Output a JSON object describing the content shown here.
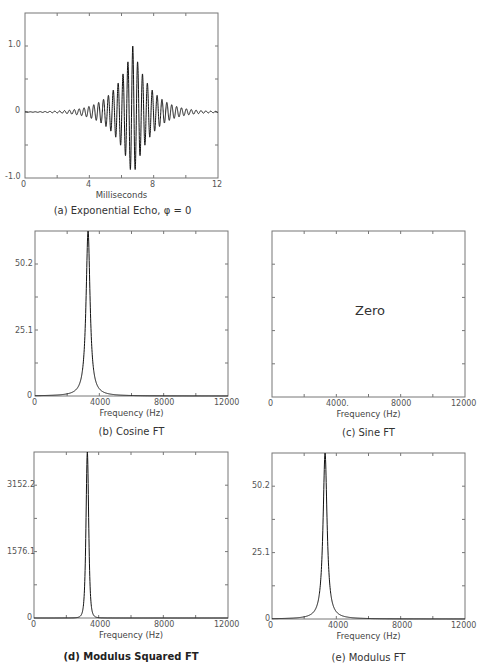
{
  "chart_data": [
    {
      "id": "a",
      "type": "line",
      "title": "(a) Exponential Echo, φ = 0",
      "xlabel": "Milliseconds",
      "ylabel": "",
      "xlim": [
        0,
        12
      ],
      "ylim": [
        -1.0,
        1.5
      ],
      "x_ticks": [
        "0",
        "4",
        "8",
        "12"
      ],
      "y_ticks": [
        "1.0",
        "0",
        "-1.0"
      ],
      "grid": false,
      "description": "Damped cosine echo with exponential envelope centered near 6.7 ms, oscillating at ~3300 Hz, peak amplitude 1.0",
      "series": [
        {
          "name": "echo",
          "center_ms": 6.7,
          "frequency_hz": 3300,
          "peak": 1.0,
          "decay_ms": 1.1
        }
      ]
    },
    {
      "id": "b",
      "type": "line",
      "title": "(b) Cosine FT",
      "xlabel": "Frequency (Hz)",
      "xlim": [
        0,
        12000
      ],
      "ylim": [
        0,
        63
      ],
      "x_ticks": [
        "0",
        "4000",
        "8000",
        "12000"
      ],
      "y_ticks": [
        "50.2",
        "25.1",
        "0"
      ],
      "grid": false,
      "series": [
        {
          "name": "cosine FT",
          "peak_x": 3300,
          "peak_y": 63,
          "shape": "lorentzian",
          "half_width_hz": 150
        }
      ]
    },
    {
      "id": "c",
      "type": "line",
      "title": "(c) Sine FT",
      "xlabel": "Frequency (Hz)",
      "xlim": [
        0,
        12000
      ],
      "x_ticks": [
        "0",
        "4000",
        "8000",
        "12000"
      ],
      "y_ticks": [],
      "annotation": "Zero",
      "series": []
    },
    {
      "id": "d",
      "type": "line",
      "title": "(d) Modulus Squared FT",
      "xlabel": "Frequency (Hz)",
      "xlim": [
        0,
        12000
      ],
      "ylim": [
        0,
        3990
      ],
      "x_ticks": [
        "0",
        "4000",
        "8000",
        "12000"
      ],
      "y_ticks": [
        "3152.2",
        "1576.1",
        "0"
      ],
      "grid": false,
      "series": [
        {
          "name": "modulus squared FT",
          "peak_x": 3300,
          "peak_y": 3990,
          "shape": "lorentzian-squared",
          "half_width_hz": 150
        }
      ]
    },
    {
      "id": "e",
      "type": "line",
      "title": "(e) Modulus FT",
      "xlabel": "Frequency (Hz)",
      "xlim": [
        0,
        12000
      ],
      "ylim": [
        0,
        63
      ],
      "x_ticks": [
        "0",
        "4000",
        "8000",
        "12000"
      ],
      "y_ticks": [
        "50.2",
        "25.1",
        "0"
      ],
      "grid": false,
      "series": [
        {
          "name": "modulus FT",
          "peak_x": 3300,
          "peak_y": 63,
          "shape": "lorentzian",
          "half_width_hz": 150
        }
      ]
    }
  ],
  "panels": {
    "a": {
      "xlabel": "Milliseconds",
      "caption": "(a) Exponential Echo, φ = 0",
      "xt": [
        "0",
        "4",
        "8",
        "12"
      ],
      "yt": [
        "1.0",
        "0",
        "-1.0"
      ]
    },
    "b": {
      "xlabel": "Frequency (Hz)",
      "caption": "(b) Cosine FT",
      "xt": [
        "0",
        "4000",
        "8000",
        "12000"
      ],
      "yt": [
        "50.2",
        "25.1",
        "0"
      ]
    },
    "c": {
      "xlabel": "Frequency (Hz)",
      "caption": "(c) Sine FT",
      "annotation": "Zero",
      "xt": [
        "0",
        "4000.",
        "8000",
        "12000"
      ]
    },
    "d": {
      "xlabel": "Frequency (Hz)",
      "caption": "(d) Modulus Squared FT",
      "xt": [
        "0",
        "4000",
        "8000",
        "12000"
      ],
      "yt": [
        "3152.2",
        "1576.1",
        "0"
      ]
    },
    "e": {
      "xlabel": "Frequency (Hz)",
      "caption": "(e) Modulus FT",
      "xt": [
        "0",
        "4000",
        "8000",
        "12000"
      ],
      "yt": [
        "50.2",
        "25.1",
        "0"
      ]
    }
  }
}
